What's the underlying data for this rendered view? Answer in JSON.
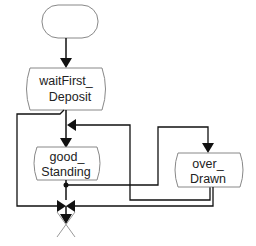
{
  "diagram": {
    "type": "state-chart",
    "start_terminal": {
      "label": ""
    },
    "states": [
      {
        "id": "waitFirstDeposit",
        "lines": [
          "waitFirst_",
          "Deposit"
        ]
      },
      {
        "id": "goodStanding",
        "lines": [
          "good_",
          "Standing"
        ]
      },
      {
        "id": "overDrawn",
        "lines": [
          "over_",
          "Drawn"
        ]
      }
    ],
    "connectors": [
      {
        "from": "start",
        "to": "waitFirstDeposit"
      },
      {
        "from": "waitFirstDeposit",
        "to": "goodStanding"
      },
      {
        "from": "waitFirstDeposit",
        "to": "join"
      },
      {
        "from": "goodStanding",
        "to": "overDrawn"
      },
      {
        "from": "overDrawn",
        "to": "goodStanding"
      },
      {
        "from": "overDrawn",
        "to": "join"
      },
      {
        "from": "goodStanding",
        "to": "join"
      },
      {
        "from": "join",
        "to": "end"
      }
    ],
    "colors": {
      "line": "#111111",
      "box_stroke": "#888888",
      "text": "#222222"
    }
  }
}
